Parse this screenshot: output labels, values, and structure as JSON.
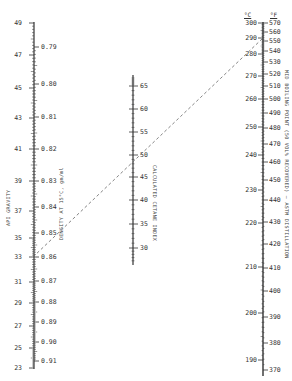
{
  "diagram": {
    "type": "nomograph",
    "scales": {
      "api_gravity": {
        "title": "API GRAVITY",
        "ticks": [
          {
            "value": "49",
            "y": 23
          },
          {
            "value": "47",
            "y": 55
          },
          {
            "value": "45",
            "y": 88
          },
          {
            "value": "43",
            "y": 118
          },
          {
            "value": "41",
            "y": 149
          },
          {
            "value": "39",
            "y": 181
          },
          {
            "value": "37",
            "y": 211
          },
          {
            "value": "35",
            "y": 238
          },
          {
            "value": "33",
            "y": 257
          },
          {
            "value": "31",
            "y": 282
          },
          {
            "value": "29",
            "y": 303
          },
          {
            "value": "27",
            "y": 326
          },
          {
            "value": "25",
            "y": 348
          },
          {
            "value": "23",
            "y": 368
          }
        ]
      },
      "density": {
        "title": "DENSITY AT 15°C, gm/ml",
        "ticks": [
          {
            "value": "0.79",
            "y": 47
          },
          {
            "value": "0.80",
            "y": 84
          },
          {
            "value": "0.81",
            "y": 117
          },
          {
            "value": "0.82",
            "y": 149
          },
          {
            "value": "0.83",
            "y": 181
          },
          {
            "value": "0.84",
            "y": 207
          },
          {
            "value": "0.85",
            "y": 233
          },
          {
            "value": "0.86",
            "y": 257
          },
          {
            "value": "0.87",
            "y": 281
          },
          {
            "value": "0.88",
            "y": 302
          },
          {
            "value": "0.89",
            "y": 322
          },
          {
            "value": "0.90",
            "y": 342
          },
          {
            "value": "0.91",
            "y": 361
          }
        ]
      },
      "cetane_index": {
        "title": "CALCULATED CETANE INDEX",
        "ticks": [
          {
            "value": "65",
            "y": 86
          },
          {
            "value": "60",
            "y": 109
          },
          {
            "value": "55",
            "y": 132
          },
          {
            "value": "50",
            "y": 155
          },
          {
            "value": "45",
            "y": 177
          },
          {
            "value": "40",
            "y": 200
          },
          {
            "value": "35",
            "y": 224
          },
          {
            "value": "30",
            "y": 248
          }
        ]
      },
      "mid_boiling_c": {
        "unit": "°C",
        "ticks": [
          {
            "value": "300",
            "y": 23
          },
          {
            "value": "290",
            "y": 38
          },
          {
            "value": "280",
            "y": 54
          },
          {
            "value": "270",
            "y": 76
          },
          {
            "value": "260",
            "y": 99
          },
          {
            "value": "250",
            "y": 127
          },
          {
            "value": "240",
            "y": 155
          },
          {
            "value": "230",
            "y": 190
          },
          {
            "value": "220",
            "y": 223
          },
          {
            "value": "210",
            "y": 267
          },
          {
            "value": "200",
            "y": 313
          },
          {
            "value": "190",
            "y": 360
          }
        ]
      },
      "mid_boiling_f": {
        "unit": "°F",
        "title": "MID BOILING POINT (50 VOL% RECOVERED) — ASTM DISTILLATION",
        "ticks": [
          {
            "value": "570",
            "y": 23
          },
          {
            "value": "560",
            "y": 32
          },
          {
            "value": "550",
            "y": 41
          },
          {
            "value": "540",
            "y": 51
          },
          {
            "value": "530",
            "y": 62
          },
          {
            "value": "520",
            "y": 74
          },
          {
            "value": "510",
            "y": 86
          },
          {
            "value": "500",
            "y": 99
          },
          {
            "value": "490",
            "y": 113
          },
          {
            "value": "480",
            "y": 128
          },
          {
            "value": "470",
            "y": 144
          },
          {
            "value": "460",
            "y": 162
          },
          {
            "value": "450",
            "y": 180
          },
          {
            "value": "440",
            "y": 200
          },
          {
            "value": "430",
            "y": 222
          },
          {
            "value": "420",
            "y": 244
          },
          {
            "value": "410",
            "y": 268
          },
          {
            "value": "400",
            "y": 291
          },
          {
            "value": "390",
            "y": 317
          },
          {
            "value": "380",
            "y": 343
          },
          {
            "value": "370",
            "y": 370
          }
        ]
      }
    },
    "example_line": {
      "x1": 33,
      "y1": 257,
      "x2": 263,
      "y2": 38,
      "style": "dashed"
    },
    "colors": {
      "ink": "#333333",
      "background": "#ffffff"
    }
  }
}
